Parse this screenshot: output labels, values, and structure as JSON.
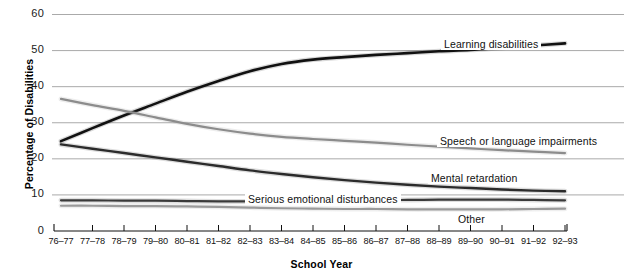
{
  "chart_data": {
    "type": "line",
    "title": "",
    "xlabel": "School Year",
    "ylabel": "Percentage of Disabilities",
    "ylim": [
      0,
      60
    ],
    "yticks": [
      0,
      10,
      20,
      30,
      40,
      50,
      60
    ],
    "grid": true,
    "legend_position": "inline-annotations",
    "categories": [
      "76–77",
      "77–78",
      "78–79",
      "79–80",
      "80–81",
      "81–82",
      "82–83",
      "83–84",
      "84–85",
      "85–86",
      "86–87",
      "87–88",
      "88–89",
      "89–90",
      "90–91",
      "91–92",
      "92–93"
    ],
    "series": [
      {
        "name": "Learning disabilities",
        "color": "#111111",
        "values": [
          24.9,
          28.5,
          32.0,
          35.3,
          38.6,
          41.6,
          44.3,
          46.3,
          47.5,
          48.2,
          48.8,
          49.3,
          49.8,
          50.2,
          50.8,
          51.4,
          52.0
        ]
      },
      {
        "name": "Speech or language impairments",
        "color": "#8c8c8c",
        "values": [
          36.6,
          34.9,
          33.3,
          31.5,
          29.7,
          28.2,
          27.0,
          26.1,
          25.5,
          25.0,
          24.5,
          23.9,
          23.4,
          22.9,
          22.4,
          22.0,
          21.6
        ]
      },
      {
        "name": "Mental retardation",
        "color": "#2b2b2b",
        "values": [
          24.0,
          22.8,
          21.6,
          20.4,
          19.2,
          18.0,
          16.8,
          15.8,
          14.9,
          14.1,
          13.4,
          12.8,
          12.3,
          11.9,
          11.5,
          11.2,
          11.0
        ]
      },
      {
        "name": "Serious emotional disturbances",
        "color": "#3a3a3a",
        "values": [
          8.5,
          8.5,
          8.4,
          8.4,
          8.3,
          8.2,
          8.2,
          8.3,
          8.4,
          8.5,
          8.6,
          8.6,
          8.7,
          8.7,
          8.7,
          8.6,
          8.5
        ]
      },
      {
        "name": "Other",
        "color": "#9a9a9a",
        "values": [
          7.0,
          7.0,
          6.9,
          6.9,
          6.8,
          6.7,
          6.5,
          6.3,
          6.2,
          6.1,
          6.1,
          6.0,
          6.0,
          6.0,
          6.0,
          6.1,
          6.2
        ]
      }
    ],
    "annotations": [
      {
        "text": "Learning disabilities",
        "x_px": 441,
        "y_px": 38
      },
      {
        "text": "Speech or language impairments",
        "x_px": 437,
        "y_px": 135
      },
      {
        "text": "Mental retardation",
        "x_px": 428,
        "y_px": 172
      },
      {
        "text": "Serious emotional disturbances",
        "x_px": 245,
        "y_px": 193
      },
      {
        "text": "Other",
        "x_px": 455,
        "y_px": 213
      }
    ]
  }
}
